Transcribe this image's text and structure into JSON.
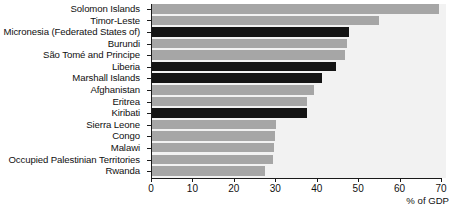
{
  "chart_data": {
    "type": "bar",
    "orientation": "horizontal",
    "title": "",
    "xlabel": "% of GDP",
    "ylabel": "",
    "xlim": [
      0,
      70
    ],
    "xticks": [
      0,
      10,
      20,
      30,
      40,
      50,
      60,
      70
    ],
    "grid": false,
    "legend": null,
    "categories": [
      "Solomon Islands",
      "Timor-Leste",
      "Micronesia (Federated States of)",
      "Burundi",
      "São Tomé and Principe",
      "Liberia",
      "Marshall Islands",
      "Afghanistan",
      "Eritrea",
      "Kiribati",
      "Sierra Leone",
      "Congo",
      "Malawi",
      "Occupied Palestinian Territories",
      "Rwanda"
    ],
    "values": [
      68.4,
      54.0,
      46.8,
      46.5,
      46.0,
      43.8,
      40.5,
      38.5,
      37.0,
      37.0,
      29.5,
      29.2,
      29.0,
      28.7,
      27.0
    ],
    "bar_styles": [
      "light",
      "light",
      "dark",
      "light",
      "light",
      "dark",
      "dark",
      "light",
      "light",
      "dark",
      "light",
      "light",
      "light",
      "light",
      "light"
    ],
    "colors": {
      "light_bar": "#a6a6a6",
      "dark_bar": "#141414",
      "plot_background": "#f2f2f2",
      "axis": "#1a1a1a",
      "text": "#101010"
    }
  }
}
